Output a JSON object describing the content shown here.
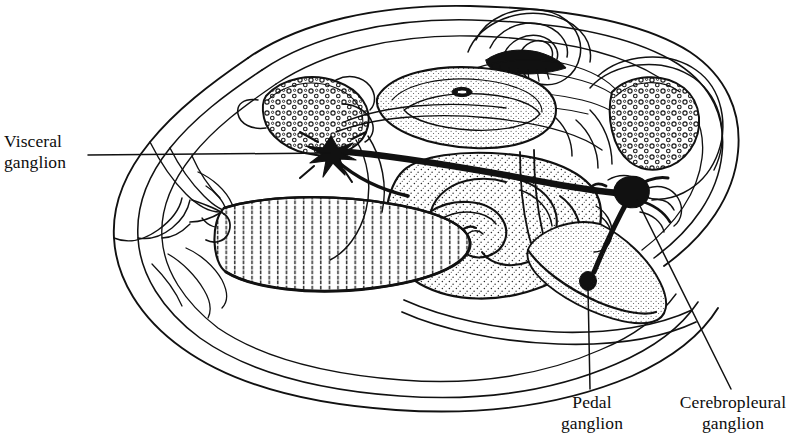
{
  "figure": {
    "kind": "anatomical-line-drawing",
    "ink_color": "#111111",
    "background_color": "#ffffff",
    "stipple_color": "#2b2b2b"
  },
  "labels": {
    "visceral": {
      "line1": "Visceral",
      "line2": "ganglion"
    },
    "pedal": {
      "line1": "Pedal",
      "line2": "ganglion"
    },
    "cerebropleural": {
      "line1": "Cerebropleural",
      "line2": "ganglion"
    }
  },
  "structures": {
    "visceral_ganglion": {
      "name": "visceral-ganglion-node",
      "shape": "star",
      "x": 331,
      "y": 152
    },
    "cerebropleural_ganglion": {
      "name": "cerebropleural-ganglion-node",
      "shape": "blob",
      "x": 632,
      "y": 194
    },
    "pedal_ganglion": {
      "name": "pedal-ganglion-node",
      "shape": "dot",
      "x": 588,
      "y": 283
    },
    "connective_main": {
      "name": "visceral-cerebropleural-connective"
    },
    "connective_pedal": {
      "name": "cerebropleural-pedal-connective"
    }
  },
  "leaders": {
    "visceral": {
      "x1": 88,
      "y1": 155,
      "x2": 330,
      "y2": 153
    },
    "pedal": {
      "x1": 588,
      "y1": 285,
      "x2": 590,
      "y2": 389
    },
    "cerebropleural": {
      "x1": 637,
      "y1": 199,
      "x2": 731,
      "y2": 389
    }
  }
}
